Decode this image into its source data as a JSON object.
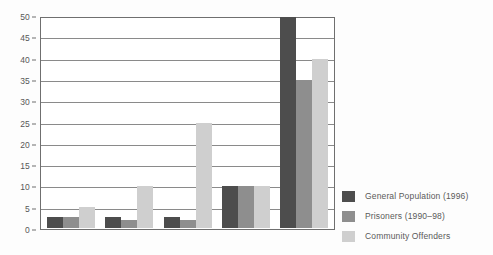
{
  "chart_data": {
    "type": "bar",
    "title": "",
    "subtitle": "",
    "xlabel": "",
    "ylabel": "",
    "ylim": [
      0,
      50
    ],
    "yticks": [
      0,
      5,
      10,
      15,
      20,
      25,
      30,
      35,
      40,
      45,
      50
    ],
    "ytick_labels": [
      "0",
      "5",
      "10",
      "15",
      "20",
      "25",
      "30",
      "35",
      "40",
      "45",
      "50"
    ],
    "grid": true,
    "legend_position": "right",
    "categories": [
      "",
      "",
      "",
      "",
      ""
    ],
    "series": [
      {
        "name": "General Population (1996)",
        "color": "#4d4d4d",
        "values": [
          2.5,
          2.5,
          2.5,
          10,
          50
        ]
      },
      {
        "name": "Prisoners (1990–98)",
        "color": "#8e8e8e",
        "values": [
          2.5,
          2,
          2,
          10,
          35
        ]
      },
      {
        "name": "Community Offenders",
        "color": "#cfcfcf",
        "values": [
          5,
          10,
          25,
          10,
          40
        ]
      }
    ]
  },
  "legend": {
    "items": [
      {
        "label": "General Population (1996)",
        "color": "#4d4d4d"
      },
      {
        "label": "Prisoners (1990–98)",
        "color": "#8e8e8e"
      },
      {
        "label": "Community Offenders",
        "color": "#cfcfcf"
      }
    ]
  },
  "colors": {
    "axis": "#6f6f6f",
    "gridline": "#8a8a8a",
    "tick_text": "#575757",
    "legend_text": "#5a5a5a",
    "background": "#fdfdfd",
    "plot_background": "#ffffff"
  }
}
